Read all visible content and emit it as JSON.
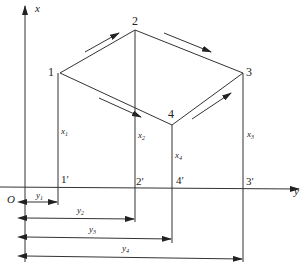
{
  "diagram": {
    "type": "coordinate-projection",
    "axes": {
      "vertical": {
        "label": "x"
      },
      "horizontal": {
        "label": "y"
      },
      "origin": {
        "label": "O"
      }
    },
    "points": [
      {
        "id": "1",
        "label": "1",
        "projection_label": "1′",
        "height_label": "x",
        "height_sub": "1",
        "offset_label": "y",
        "offset_sub": "1"
      },
      {
        "id": "2",
        "label": "2",
        "projection_label": "2′",
        "height_label": "x",
        "height_sub": "2",
        "offset_label": "y",
        "offset_sub": "2"
      },
      {
        "id": "3",
        "label": "3",
        "projection_label": "3′",
        "height_label": "x",
        "height_sub": "3",
        "offset_label": "y",
        "offset_sub": "3"
      },
      {
        "id": "4",
        "label": "4",
        "projection_label": "4′",
        "height_label": "x",
        "height_sub": "4",
        "offset_label": "y",
        "offset_sub": "4"
      }
    ],
    "edges": [
      {
        "from": "1",
        "to": "2",
        "direction_arrow": "toward-2"
      },
      {
        "from": "2",
        "to": "3",
        "direction_arrow": "toward-3"
      },
      {
        "from": "1",
        "to": "4",
        "direction_arrow": "toward-4"
      },
      {
        "from": "4",
        "to": "3",
        "direction_arrow": "toward-3"
      }
    ],
    "colors": {
      "line": "#333333",
      "background": "#ffffff"
    }
  }
}
